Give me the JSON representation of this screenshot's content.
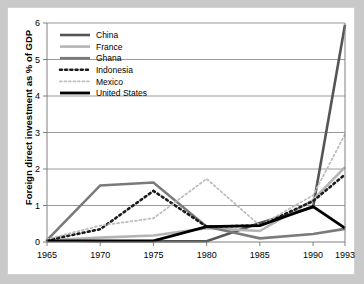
{
  "chart_data": {
    "type": "line",
    "title": "",
    "xlabel": "",
    "ylabel": "Foreign direct investment as % of GDP",
    "x": [
      1965,
      1970,
      1975,
      1980,
      1985,
      1990,
      1993
    ],
    "xticklabels": [
      "1965",
      "1970",
      "1975",
      "1980",
      "1985",
      "1990",
      "1993"
    ],
    "yticklabels": [
      "0",
      "1",
      "2",
      "3",
      "4",
      "5",
      "6"
    ],
    "yticks": [
      0,
      1,
      2,
      3,
      4,
      5,
      6
    ],
    "ylim": [
      0,
      6
    ],
    "xlim": [
      1965,
      1993
    ],
    "grid": "horizontal",
    "legend_position": "top-left",
    "series": [
      {
        "name": "China",
        "color": "#555555",
        "style": "solid",
        "width": 2.6,
        "values": [
          0.05,
          0.02,
          0.02,
          0.02,
          0.52,
          0.95,
          5.95
        ]
      },
      {
        "name": "France",
        "color": "#b4b4b4",
        "style": "solid",
        "width": 2.6,
        "values": [
          0.05,
          0.12,
          0.18,
          0.38,
          0.3,
          1.15,
          2.05
        ]
      },
      {
        "name": "Ghana",
        "color": "#7a7a7a",
        "style": "solid",
        "width": 2.6,
        "values": [
          0.05,
          1.55,
          1.63,
          0.42,
          0.1,
          0.22,
          0.36
        ]
      },
      {
        "name": "Indonesia",
        "color": "#1a1a1a",
        "style": "dotted-thick",
        "width": 2.6,
        "values": [
          0.05,
          0.35,
          1.4,
          0.42,
          0.45,
          1.12,
          1.85
        ]
      },
      {
        "name": "Mexico",
        "color": "#bdbdbd",
        "style": "dotted-thin",
        "width": 1.8,
        "values": [
          0.08,
          0.45,
          0.65,
          1.73,
          0.45,
          1.28,
          2.95
        ]
      },
      {
        "name": "United States",
        "color": "#000000",
        "style": "solid",
        "width": 2.8,
        "values": [
          0.03,
          0.03,
          0.03,
          0.42,
          0.45,
          0.97,
          0.38
        ]
      }
    ]
  }
}
